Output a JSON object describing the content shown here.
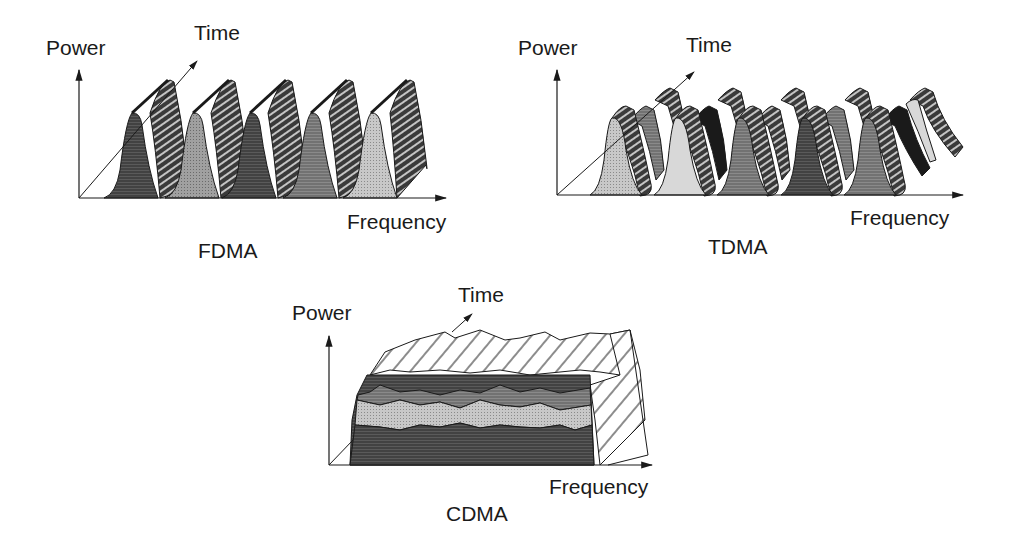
{
  "panels": {
    "fdma": {
      "title": "FDMA",
      "y_label": "Power",
      "z_label": "Time",
      "x_label": "Frequency",
      "channels": 5
    },
    "tdma": {
      "title": "TDMA",
      "y_label": "Power",
      "z_label": "Time",
      "x_label": "Frequency",
      "channels": 5,
      "time_slots": 3
    },
    "cdma": {
      "title": "CDMA",
      "y_label": "Power",
      "z_label": "Time",
      "x_label": "Frequency",
      "layers": 4
    }
  },
  "colors": {
    "line": "#1a1a1a",
    "dark": "#4a4a4a",
    "mid": "#7a7a7a",
    "light": "#b8b8b8",
    "pale": "#d8d8d8",
    "background": "#ffffff"
  }
}
